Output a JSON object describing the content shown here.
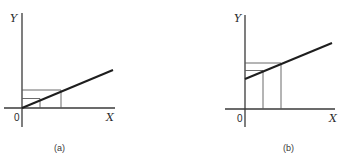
{
  "panels": [
    {
      "caption": "(a)",
      "y_axis_label": "Y",
      "x_axis_label": "X",
      "origin_label": "0",
      "line": {
        "intercept": "zero",
        "description": "line through origin with positive slope"
      },
      "guides": [
        {
          "x_position": "x1",
          "description": "vertical and horizontal projection from line to axes"
        },
        {
          "x_position": "x2",
          "description": "vertical and horizontal projection from line to axes"
        }
      ]
    },
    {
      "caption": "(b)",
      "y_axis_label": "Y",
      "x_axis_label": "X",
      "origin_label": "0",
      "line": {
        "intercept": "positive",
        "description": "line with positive Y-intercept and positive slope"
      },
      "guides": [
        {
          "x_position": "x1",
          "description": "vertical and horizontal projection from line to axes"
        },
        {
          "x_position": "x2",
          "description": "vertical and horizontal projection from line to axes"
        }
      ]
    }
  ],
  "colors": {
    "ink": "#1e1e1e",
    "background": "#ffffff"
  }
}
